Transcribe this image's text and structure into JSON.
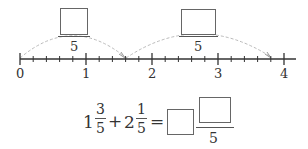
{
  "number_line": {
    "start": 0,
    "end": 4,
    "major_labels": [
      "0",
      "1",
      "2",
      "3",
      "4"
    ],
    "minor_divisions_per_unit": 5,
    "jumps": [
      {
        "from": 0,
        "to": 1.6,
        "answer_box": "blank",
        "denominator": "5"
      },
      {
        "from": 1.6,
        "to": 3.8,
        "answer_box": "blank",
        "denominator": "5"
      }
    ]
  },
  "equation": {
    "term1_whole": "1",
    "term1_num": "3",
    "term1_den": "5",
    "plus": "+",
    "term2_whole": "2",
    "term2_num": "1",
    "term2_den": "5",
    "equals": "=",
    "result_whole": "",
    "result_num": "",
    "result_den": "5"
  },
  "colors": {
    "line": "#333333",
    "arc": "#bbbbbb",
    "box_border": "#666666"
  }
}
